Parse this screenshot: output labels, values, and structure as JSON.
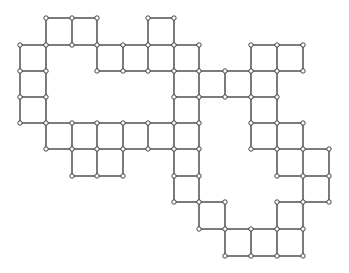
{
  "diagram": {
    "line_color": "#333333",
    "node_fill": "#ffffff",
    "columns_x": [
      20,
      46,
      72,
      97,
      123,
      148,
      174,
      199,
      225,
      251,
      277,
      303,
      329
    ],
    "rows_y": [
      18,
      45,
      71,
      97,
      123,
      149,
      176,
      202,
      229,
      256
    ],
    "cells": [
      [
        1,
        0
      ],
      [
        2,
        0
      ],
      [
        5,
        0
      ],
      [
        0,
        1
      ],
      [
        3,
        1
      ],
      [
        4,
        1
      ],
      [
        5,
        1
      ],
      [
        6,
        1
      ],
      [
        9,
        1
      ],
      [
        10,
        1
      ],
      [
        0,
        2
      ],
      [
        6,
        2
      ],
      [
        7,
        2
      ],
      [
        8,
        2
      ],
      [
        9,
        2
      ],
      [
        0,
        3
      ],
      [
        6,
        3
      ],
      [
        9,
        3
      ],
      [
        1,
        4
      ],
      [
        2,
        4
      ],
      [
        3,
        4
      ],
      [
        4,
        4
      ],
      [
        5,
        4
      ],
      [
        6,
        4
      ],
      [
        9,
        4
      ],
      [
        10,
        4
      ],
      [
        2,
        5
      ],
      [
        3,
        5
      ],
      [
        6,
        5
      ],
      [
        10,
        5
      ],
      [
        11,
        5
      ],
      [
        6,
        6
      ],
      [
        11,
        6
      ],
      [
        7,
        7
      ],
      [
        10,
        7
      ],
      [
        8,
        8
      ],
      [
        9,
        8
      ],
      [
        10,
        8
      ]
    ]
  }
}
